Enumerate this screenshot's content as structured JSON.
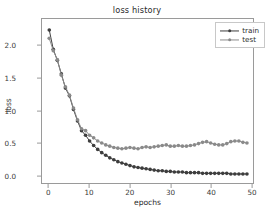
{
  "chart_data": {
    "type": "line",
    "title": "loss history",
    "xlabel": "epochs",
    "ylabel": "loss",
    "xlim": [
      -1.8,
      50.5
    ],
    "ylim": [
      -0.12,
      2.42
    ],
    "xticks": [
      0,
      10,
      20,
      30,
      40,
      50
    ],
    "yticks": [
      0.0,
      0.5,
      1.0,
      1.5,
      2.0
    ],
    "ytick_labels": [
      "0.0",
      "0.5",
      "1.0",
      "1.5",
      "2.0"
    ],
    "xtick_labels": [
      "0",
      "10",
      "20",
      "30",
      "40",
      "50"
    ],
    "grid": false,
    "legend_position": "upper right",
    "marker": "circle",
    "x": [
      0,
      1,
      2,
      3,
      4,
      5,
      6,
      7,
      8,
      9,
      10,
      11,
      12,
      13,
      14,
      15,
      16,
      17,
      18,
      19,
      20,
      21,
      22,
      23,
      24,
      25,
      26,
      27,
      28,
      29,
      30,
      31,
      32,
      33,
      34,
      35,
      36,
      37,
      38,
      39,
      40,
      41,
      42,
      43,
      44,
      45,
      46,
      47,
      48,
      49
    ],
    "series": [
      {
        "name": "train",
        "color": "#3d3d3d",
        "values": [
          2.25,
          1.95,
          1.78,
          1.57,
          1.35,
          1.23,
          1.02,
          0.84,
          0.69,
          0.62,
          0.53,
          0.46,
          0.4,
          0.35,
          0.31,
          0.27,
          0.24,
          0.21,
          0.19,
          0.17,
          0.15,
          0.13,
          0.12,
          0.11,
          0.1,
          0.09,
          0.08,
          0.07,
          0.07,
          0.06,
          0.06,
          0.05,
          0.05,
          0.05,
          0.04,
          0.04,
          0.04,
          0.04,
          0.03,
          0.03,
          0.03,
          0.03,
          0.03,
          0.03,
          0.03,
          0.02,
          0.02,
          0.02,
          0.02,
          0.02
        ]
      },
      {
        "name": "test",
        "color": "#8a8a8a",
        "values": [
          2.12,
          1.93,
          1.79,
          1.55,
          1.37,
          1.24,
          1.04,
          0.86,
          0.72,
          0.69,
          0.62,
          0.58,
          0.53,
          0.5,
          0.47,
          0.45,
          0.43,
          0.42,
          0.41,
          0.42,
          0.43,
          0.42,
          0.41,
          0.43,
          0.44,
          0.43,
          0.44,
          0.45,
          0.46,
          0.47,
          0.45,
          0.45,
          0.46,
          0.45,
          0.45,
          0.46,
          0.47,
          0.49,
          0.51,
          0.52,
          0.5,
          0.48,
          0.47,
          0.47,
          0.49,
          0.52,
          0.53,
          0.53,
          0.51,
          0.5
        ]
      }
    ],
    "legend": [
      {
        "label": "train",
        "color": "#3d3d3d"
      },
      {
        "label": "test",
        "color": "#8a8a8a"
      }
    ]
  }
}
